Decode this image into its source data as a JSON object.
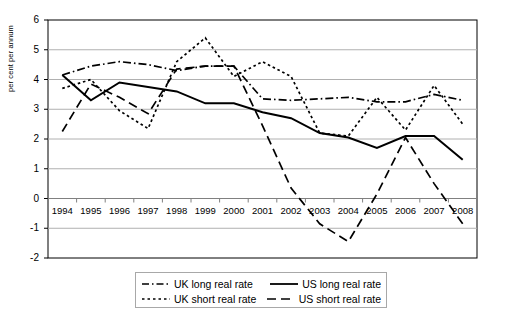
{
  "chart_data": {
    "type": "line",
    "title": "",
    "xlabel": "",
    "ylabel": "per cent per annum",
    "categories": [
      "1994",
      "1995",
      "1996",
      "1997",
      "1998",
      "1999",
      "2000",
      "2001",
      "2002",
      "2003",
      "2004",
      "2005",
      "2006",
      "2007",
      "2008"
    ],
    "ylim": [
      -2,
      6
    ],
    "yticks": [
      -2,
      -1,
      0,
      1,
      2,
      3,
      4,
      5,
      6
    ],
    "grid": true,
    "legend_position": "bottom",
    "series": [
      {
        "name": "UK long real rate",
        "style": "dash-dot",
        "color": "#000000",
        "values": [
          4.15,
          4.45,
          4.6,
          4.5,
          4.3,
          4.45,
          4.45,
          3.35,
          3.3,
          3.35,
          3.4,
          3.25,
          3.25,
          3.5,
          3.3
        ]
      },
      {
        "name": "US long real rate",
        "style": "solid",
        "color": "#000000",
        "values": [
          4.15,
          3.3,
          3.9,
          3.75,
          3.6,
          3.2,
          3.2,
          2.9,
          2.7,
          2.2,
          2.05,
          1.7,
          2.1,
          2.1,
          1.3
        ]
      },
      {
        "name": "UK short real rate",
        "style": "dotted",
        "color": "#000000",
        "values": [
          3.7,
          4.0,
          2.95,
          2.35,
          4.6,
          5.4,
          4.1,
          4.6,
          4.1,
          2.2,
          2.1,
          3.4,
          2.3,
          3.8,
          2.5
        ]
      },
      {
        "name": "US short real rate",
        "style": "dashed",
        "color": "#000000",
        "values": [
          2.25,
          3.85,
          3.4,
          2.85,
          4.35,
          4.45,
          4.45,
          2.45,
          0.35,
          -0.85,
          -1.45,
          0.15,
          2.05,
          0.5,
          -0.85
        ]
      }
    ]
  },
  "legend": {
    "entries": [
      {
        "label": "UK long real rate",
        "style": "dash-dot"
      },
      {
        "label": "US long real rate",
        "style": "solid"
      },
      {
        "label": "UK short real rate",
        "style": "dotted"
      },
      {
        "label": "US short real rate",
        "style": "dashed"
      }
    ]
  }
}
